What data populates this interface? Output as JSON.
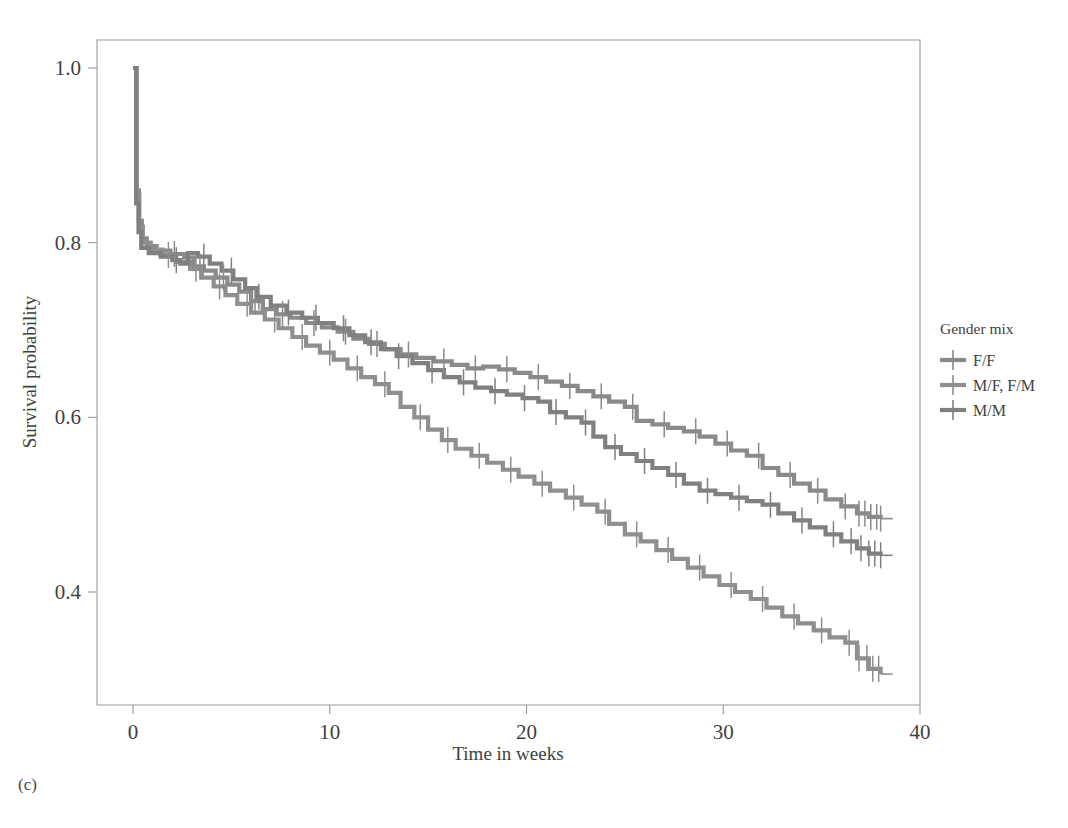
{
  "panel": {
    "label": "(c)"
  },
  "colors": {
    "curve_ff": "#8a8a8a",
    "curve_mixed": "#8f8f8f",
    "curve_mm": "#808080",
    "frame": "#9a9a9a",
    "text": "#3f3f3f",
    "background": "#ffffff"
  },
  "legend": {
    "title": "Gender mix",
    "items": [
      {
        "label": "F/F",
        "color": "#8a8a8a"
      },
      {
        "label": "M/F, F/M",
        "color": "#8f8f8f"
      },
      {
        "label": "M/M",
        "color": "#808080"
      }
    ]
  },
  "chart_data": {
    "type": "line",
    "title": "",
    "xlabel": "Time in weeks",
    "ylabel": "Survival probability",
    "xlim": [
      0,
      40
    ],
    "ylim": [
      0.28,
      1.02
    ],
    "xticks": [
      0,
      10,
      20,
      30,
      40
    ],
    "xtick_labels": [
      "0",
      "10",
      "20",
      "30",
      "40"
    ],
    "yticks": [
      0.4,
      0.6,
      0.8,
      1.0
    ],
    "ytick_labels": [
      "0.4",
      "0.6",
      "0.8",
      "1.0"
    ],
    "grid": false,
    "legend_position": "right",
    "plot_style": "kaplan-meier step curves with censoring tick marks",
    "series": [
      {
        "name": "F/F",
        "color": "#8a8a8a",
        "points": [
          [
            0.0,
            1.0
          ],
          [
            0.18,
            0.86
          ],
          [
            0.3,
            0.825
          ],
          [
            0.45,
            0.805
          ],
          [
            0.7,
            0.796
          ],
          [
            1.2,
            0.791
          ],
          [
            1.9,
            0.787
          ],
          [
            2.6,
            0.783
          ],
          [
            3.1,
            0.773
          ],
          [
            3.6,
            0.768
          ],
          [
            4.2,
            0.76
          ],
          [
            4.8,
            0.752
          ],
          [
            5.4,
            0.744
          ],
          [
            6.0,
            0.733
          ],
          [
            6.6,
            0.724
          ],
          [
            7.3,
            0.718
          ],
          [
            8.0,
            0.714
          ],
          [
            8.8,
            0.708
          ],
          [
            9.6,
            0.703
          ],
          [
            10.4,
            0.698
          ],
          [
            11.2,
            0.69
          ],
          [
            12.0,
            0.684
          ],
          [
            12.8,
            0.678
          ],
          [
            13.6,
            0.672
          ],
          [
            14.4,
            0.668
          ],
          [
            15.3,
            0.664
          ],
          [
            16.2,
            0.66
          ],
          [
            17.0,
            0.656
          ],
          [
            17.8,
            0.658
          ],
          [
            18.6,
            0.655
          ],
          [
            19.4,
            0.651
          ],
          [
            20.2,
            0.646
          ],
          [
            21.0,
            0.641
          ],
          [
            21.8,
            0.636
          ],
          [
            22.6,
            0.63
          ],
          [
            23.4,
            0.624
          ],
          [
            24.2,
            0.618
          ],
          [
            25.0,
            0.612
          ],
          [
            25.6,
            0.596
          ],
          [
            26.4,
            0.592
          ],
          [
            27.2,
            0.588
          ],
          [
            28.0,
            0.584
          ],
          [
            28.8,
            0.578
          ],
          [
            29.6,
            0.57
          ],
          [
            30.4,
            0.562
          ],
          [
            31.2,
            0.556
          ],
          [
            32.0,
            0.542
          ],
          [
            32.8,
            0.534
          ],
          [
            33.6,
            0.524
          ],
          [
            34.4,
            0.516
          ],
          [
            35.2,
            0.506
          ],
          [
            36.0,
            0.498
          ],
          [
            36.8,
            0.49
          ],
          [
            37.4,
            0.486
          ],
          [
            38.0,
            0.484
          ]
        ],
        "censor_times": [
          2.1,
          3.4,
          4.6,
          6.2,
          7.6,
          9.2,
          10.8,
          12.4,
          14.0,
          15.8,
          17.4,
          19.0,
          20.6,
          22.2,
          23.8,
          25.4,
          27.0,
          28.6,
          30.2,
          31.8,
          33.4,
          34.8,
          36.2,
          36.9,
          37.2,
          37.5,
          37.8,
          38.0
        ],
        "end_value": 0.484
      },
      {
        "name": "M/F, F/M",
        "color": "#8f8f8f",
        "points": [
          [
            0.0,
            1.0
          ],
          [
            0.18,
            0.855
          ],
          [
            0.32,
            0.818
          ],
          [
            0.5,
            0.8
          ],
          [
            0.9,
            0.792
          ],
          [
            1.5,
            0.786
          ],
          [
            2.2,
            0.778
          ],
          [
            2.9,
            0.77
          ],
          [
            3.5,
            0.76
          ],
          [
            4.1,
            0.75
          ],
          [
            4.7,
            0.74
          ],
          [
            5.3,
            0.73
          ],
          [
            6.0,
            0.72
          ],
          [
            6.7,
            0.712
          ],
          [
            7.4,
            0.702
          ],
          [
            8.1,
            0.692
          ],
          [
            8.8,
            0.682
          ],
          [
            9.5,
            0.674
          ],
          [
            10.2,
            0.666
          ],
          [
            10.9,
            0.656
          ],
          [
            11.6,
            0.646
          ],
          [
            12.3,
            0.638
          ],
          [
            13.0,
            0.628
          ],
          [
            13.6,
            0.612
          ],
          [
            14.3,
            0.6
          ],
          [
            15.0,
            0.586
          ],
          [
            15.7,
            0.574
          ],
          [
            16.4,
            0.564
          ],
          [
            17.2,
            0.556
          ],
          [
            18.0,
            0.548
          ],
          [
            18.8,
            0.54
          ],
          [
            19.6,
            0.532
          ],
          [
            20.4,
            0.524
          ],
          [
            21.2,
            0.516
          ],
          [
            22.0,
            0.508
          ],
          [
            22.8,
            0.5
          ],
          [
            23.6,
            0.492
          ],
          [
            24.2,
            0.478
          ],
          [
            25.0,
            0.466
          ],
          [
            25.8,
            0.458
          ],
          [
            26.6,
            0.448
          ],
          [
            27.4,
            0.438
          ],
          [
            28.2,
            0.428
          ],
          [
            29.0,
            0.418
          ],
          [
            29.8,
            0.408
          ],
          [
            30.6,
            0.4
          ],
          [
            31.4,
            0.392
          ],
          [
            32.2,
            0.382
          ],
          [
            33.0,
            0.372
          ],
          [
            33.8,
            0.364
          ],
          [
            34.6,
            0.356
          ],
          [
            35.4,
            0.348
          ],
          [
            36.2,
            0.342
          ],
          [
            36.8,
            0.324
          ],
          [
            37.4,
            0.312
          ],
          [
            38.0,
            0.306
          ]
        ],
        "censor_times": [
          1.8,
          3.2,
          4.4,
          5.8,
          7.2,
          8.6,
          10.0,
          11.4,
          12.8,
          14.6,
          16.0,
          17.6,
          19.2,
          20.8,
          22.4,
          24.0,
          25.6,
          27.2,
          28.8,
          30.4,
          32.0,
          33.6,
          35.0,
          36.4,
          36.9,
          37.3,
          37.6,
          37.9
        ],
        "end_value": 0.306
      },
      {
        "name": "M/M",
        "color": "#808080",
        "points": [
          [
            0.0,
            1.0
          ],
          [
            0.16,
            0.845
          ],
          [
            0.28,
            0.812
          ],
          [
            0.42,
            0.794
          ],
          [
            0.8,
            0.788
          ],
          [
            1.4,
            0.784
          ],
          [
            2.0,
            0.78
          ],
          [
            2.4,
            0.776
          ],
          [
            2.8,
            0.788
          ],
          [
            3.3,
            0.784
          ],
          [
            3.9,
            0.776
          ],
          [
            4.5,
            0.768
          ],
          [
            5.1,
            0.758
          ],
          [
            5.7,
            0.748
          ],
          [
            6.3,
            0.738
          ],
          [
            7.0,
            0.728
          ],
          [
            7.8,
            0.72
          ],
          [
            8.6,
            0.714
          ],
          [
            9.4,
            0.708
          ],
          [
            10.2,
            0.702
          ],
          [
            11.0,
            0.694
          ],
          [
            11.8,
            0.686
          ],
          [
            12.6,
            0.678
          ],
          [
            13.4,
            0.67
          ],
          [
            14.2,
            0.662
          ],
          [
            15.0,
            0.654
          ],
          [
            15.8,
            0.646
          ],
          [
            16.6,
            0.64
          ],
          [
            17.4,
            0.634
          ],
          [
            18.2,
            0.63
          ],
          [
            19.0,
            0.626
          ],
          [
            19.8,
            0.622
          ],
          [
            20.6,
            0.618
          ],
          [
            21.2,
            0.606
          ],
          [
            22.0,
            0.6
          ],
          [
            22.8,
            0.594
          ],
          [
            23.4,
            0.578
          ],
          [
            24.0,
            0.566
          ],
          [
            24.8,
            0.558
          ],
          [
            25.6,
            0.55
          ],
          [
            26.4,
            0.542
          ],
          [
            27.2,
            0.534
          ],
          [
            28.0,
            0.524
          ],
          [
            28.8,
            0.516
          ],
          [
            29.6,
            0.512
          ],
          [
            30.4,
            0.508
          ],
          [
            31.2,
            0.504
          ],
          [
            32.0,
            0.5
          ],
          [
            32.8,
            0.49
          ],
          [
            33.6,
            0.482
          ],
          [
            34.4,
            0.474
          ],
          [
            35.2,
            0.466
          ],
          [
            36.0,
            0.458
          ],
          [
            36.8,
            0.45
          ],
          [
            37.4,
            0.444
          ],
          [
            38.0,
            0.442
          ]
        ],
        "censor_times": [
          2.2,
          3.6,
          5.0,
          6.4,
          7.9,
          9.3,
          10.7,
          12.1,
          13.5,
          15.2,
          16.8,
          18.4,
          19.9,
          21.5,
          23.0,
          24.5,
          26.0,
          27.6,
          29.2,
          30.8,
          32.4,
          34.0,
          35.6,
          36.5,
          37.0,
          37.4,
          37.7,
          38.0
        ],
        "end_value": 0.442
      }
    ]
  }
}
